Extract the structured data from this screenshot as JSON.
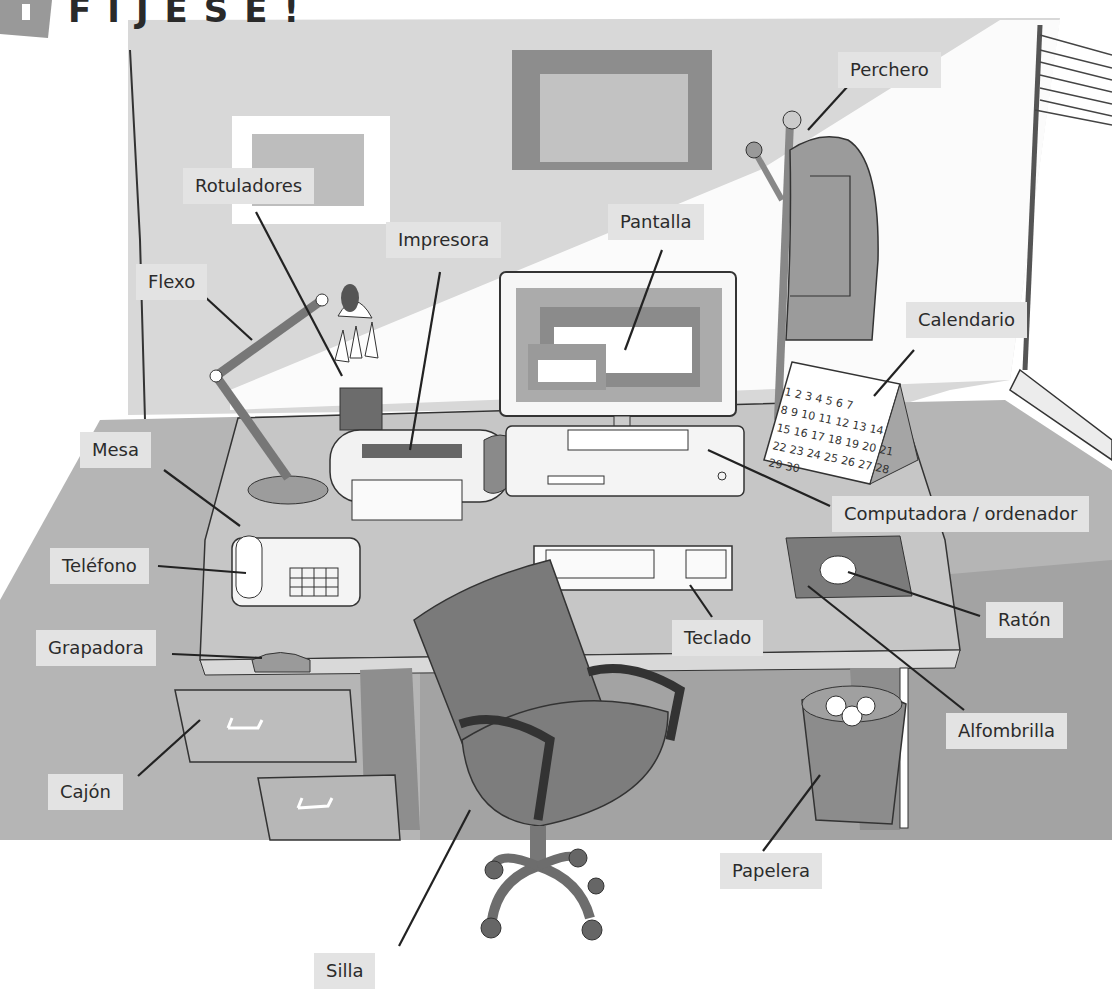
{
  "header": {
    "badge_number": "1",
    "title": "FÍJESE!"
  },
  "colors": {
    "wall": "#d6d6d6",
    "floor": "#a9a9a9",
    "desk_top": "#bebebe",
    "dark_object": "#7a7a7a",
    "label_bg": "#e3e3e3",
    "text": "#2b2b2b"
  },
  "labels": [
    {
      "id": "perchero",
      "text": "Perchero",
      "x": 838,
      "y": 52
    },
    {
      "id": "rotuladores",
      "text": "Rotuladores",
      "x": 183,
      "y": 168
    },
    {
      "id": "impresora",
      "text": "Impresora",
      "x": 386,
      "y": 222
    },
    {
      "id": "pantalla",
      "text": "Pantalla",
      "x": 608,
      "y": 204
    },
    {
      "id": "flexo",
      "text": "Flexo",
      "x": 136,
      "y": 264
    },
    {
      "id": "calendario",
      "text": "Calendario",
      "x": 906,
      "y": 302
    },
    {
      "id": "mesa",
      "text": "Mesa",
      "x": 80,
      "y": 432
    },
    {
      "id": "computadora",
      "text": "Computadora / ordenador",
      "x": 832,
      "y": 496
    },
    {
      "id": "telefono",
      "text": "Teléfono",
      "x": 50,
      "y": 548
    },
    {
      "id": "raton",
      "text": "Ratón",
      "x": 986,
      "y": 602
    },
    {
      "id": "grapadora",
      "text": "Grapadora",
      "x": 36,
      "y": 630
    },
    {
      "id": "teclado",
      "text": "Teclado",
      "x": 672,
      "y": 620
    },
    {
      "id": "alfombrilla",
      "text": "Alfombrilla",
      "x": 946,
      "y": 713
    },
    {
      "id": "cajon",
      "text": "Cajón",
      "x": 48,
      "y": 774
    },
    {
      "id": "papelera",
      "text": "Papelera",
      "x": 720,
      "y": 853
    },
    {
      "id": "silla",
      "text": "Silla",
      "x": 314,
      "y": 953
    }
  ],
  "calendar": {
    "rows": [
      "1 2 3 4 5 6 7",
      "8 9 10 11 12 13 14",
      "15 16 17 18 19 20 21",
      "22 23 24 25 26 27 28",
      "29 30"
    ]
  }
}
